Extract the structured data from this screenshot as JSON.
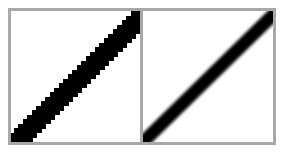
{
  "diagram": {
    "panels": [
      {
        "id": "aliased",
        "rendering": "jagged staircase pixels",
        "line_color": "#000000"
      },
      {
        "id": "anti-aliased",
        "rendering": "smooth blurred edges",
        "line_color": "#000000"
      }
    ],
    "border_color": "#a8a8a8",
    "background_color": "#ffffff"
  }
}
